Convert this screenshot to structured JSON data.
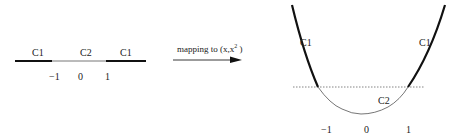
{
  "left_diagram": {
    "segments": [
      {
        "label": "C1",
        "style": "thick"
      },
      {
        "label": "C2",
        "style": "thin"
      },
      {
        "label": "C1",
        "style": "thick"
      }
    ],
    "ticks": [
      "−1",
      "0",
      "1"
    ]
  },
  "arrow": {
    "label_prefix": "mapping to (x,x",
    "label_sup": "2",
    "label_suffix": " )"
  },
  "right_diagram": {
    "curve": "parabola y = x^2",
    "labels": {
      "left_branch": "C1",
      "right_branch": "C1",
      "bottom": "C2"
    },
    "ticks": [
      "−1",
      "0",
      "1"
    ],
    "dotted_line": "horizontal at y = 1"
  },
  "colors": {
    "stroke": "#111111",
    "thin_stroke": "#555555",
    "dotted": "#666666"
  }
}
